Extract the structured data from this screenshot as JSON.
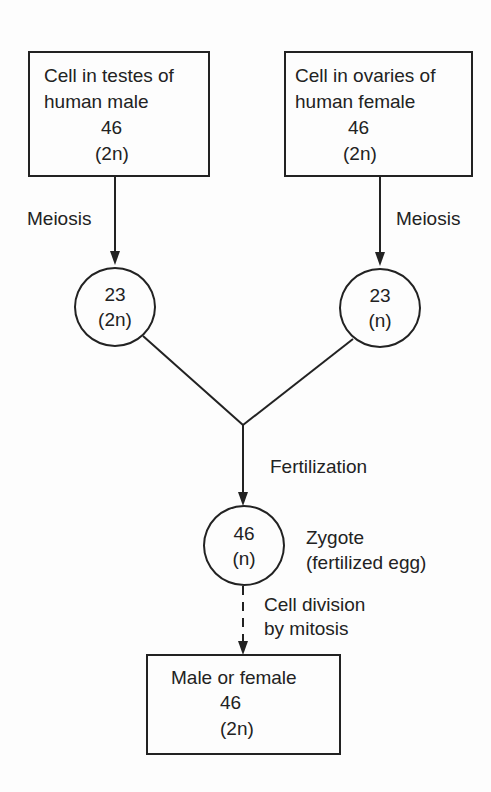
{
  "diagram": {
    "male_cell": {
      "line1": "Cell in testes of",
      "line2": "human male",
      "count": "46",
      "ploidy": "(2n)"
    },
    "female_cell": {
      "line1": "Cell in ovaries of",
      "line2": "human female",
      "count": "46",
      "ploidy": "(2n)"
    },
    "meiosis_left": "Meiosis",
    "meiosis_right": "Meiosis",
    "sperm": {
      "count": "23",
      "ploidy": "(2n)"
    },
    "egg": {
      "count": "23",
      "ploidy": "(n)"
    },
    "fertilization": "Fertilization",
    "zygote": {
      "count": "46",
      "ploidy": "(n)"
    },
    "zygote_label": {
      "line1": "Zygote",
      "line2": "(fertilized egg)"
    },
    "mitosis_label": {
      "line1": "Cell division",
      "line2": "by mitosis"
    },
    "offspring": {
      "line1": "Male or female",
      "count": "46",
      "ploidy": "(2n)"
    }
  }
}
